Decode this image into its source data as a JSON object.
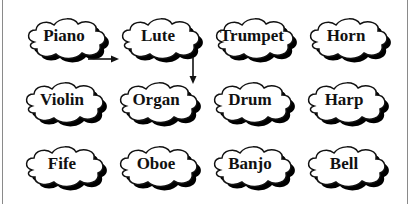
{
  "diagram": {
    "clouds": [
      {
        "label": "Piano",
        "row": 0,
        "col": 0,
        "x": 22,
        "y": 14
      },
      {
        "label": "Lute",
        "row": 0,
        "col": 1,
        "x": 116,
        "y": 14
      },
      {
        "label": "Trumpet",
        "row": 0,
        "col": 2,
        "x": 210,
        "y": 14
      },
      {
        "label": "Horn",
        "row": 0,
        "col": 3,
        "x": 304,
        "y": 14
      },
      {
        "label": "Violin",
        "row": 1,
        "col": 0,
        "x": 20,
        "y": 78
      },
      {
        "label": "Organ",
        "row": 1,
        "col": 1,
        "x": 114,
        "y": 78
      },
      {
        "label": "Drum",
        "row": 1,
        "col": 2,
        "x": 208,
        "y": 78
      },
      {
        "label": "Harp",
        "row": 1,
        "col": 3,
        "x": 302,
        "y": 78
      },
      {
        "label": "Fife",
        "row": 2,
        "col": 0,
        "x": 20,
        "y": 142
      },
      {
        "label": "Oboe",
        "row": 2,
        "col": 1,
        "x": 114,
        "y": 142
      },
      {
        "label": "Banjo",
        "row": 2,
        "col": 2,
        "x": 208,
        "y": 142
      },
      {
        "label": "Bell",
        "row": 2,
        "col": 3,
        "x": 302,
        "y": 142
      }
    ],
    "arrows": [
      {
        "from": "Piano",
        "to": "Lute",
        "direction": "right"
      },
      {
        "from": "Lute",
        "to": "Organ",
        "direction": "down"
      }
    ],
    "colors": {
      "outline": "#111111",
      "shadow": "#000000",
      "fill": "#ffffff",
      "border": "#8a8a8a"
    }
  }
}
